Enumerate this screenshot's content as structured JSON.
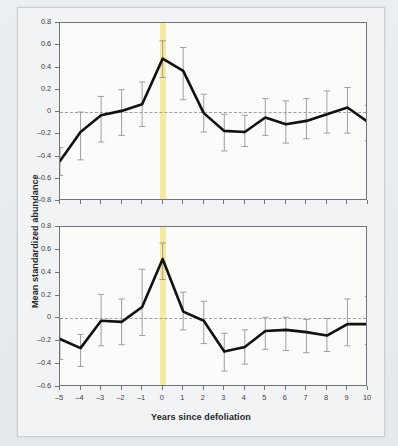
{
  "figure": {
    "yaxis_title": "Mean standardized abundance",
    "xaxis_title": "Years since defoliation",
    "band_color": "#f3e89c",
    "line_color": "#111111",
    "error_color": "#8c9094"
  },
  "chart_data": [
    {
      "type": "line",
      "title": "BLACK-BILLED CUCKOO",
      "xlabel": "Years since defoliation",
      "ylabel": "Mean standardized abundance",
      "x": [
        -5,
        -4,
        -3,
        -2,
        -1,
        0,
        1,
        2,
        3,
        4,
        5,
        6,
        7,
        8,
        9,
        10
      ],
      "xticklabels": [
        "-5",
        "-4",
        "-3",
        "-2",
        "-1",
        "0",
        "1",
        "2",
        "3",
        "4",
        "5",
        "6",
        "7",
        "8",
        "9",
        "10"
      ],
      "yticklabels": [
        "0.8",
        "0.6",
        "0.4",
        "0.2",
        "0",
        "-0.2",
        "-0.4",
        "-0.6",
        "-0.8"
      ],
      "ylim": [
        -0.8,
        0.8
      ],
      "xlim": [
        -5,
        10
      ],
      "values": [
        -0.44,
        -0.18,
        -0.03,
        0.01,
        0.07,
        0.48,
        0.37,
        -0.01,
        -0.17,
        -0.18,
        -0.05,
        -0.11,
        -0.08,
        -0.02,
        0.04,
        -0.09
      ],
      "err_upper": [
        -0.32,
        0.0,
        0.14,
        0.2,
        0.27,
        0.64,
        0.58,
        0.16,
        -0.02,
        -0.03,
        0.12,
        0.1,
        0.12,
        0.19,
        0.22,
        0.06
      ],
      "err_lower": [
        -0.57,
        -0.43,
        -0.27,
        -0.21,
        -0.13,
        0.31,
        0.11,
        -0.18,
        -0.35,
        -0.31,
        -0.21,
        -0.28,
        -0.24,
        -0.19,
        -0.19,
        -0.26
      ],
      "grid": false,
      "legend": "none",
      "highlight_x": 0,
      "zero_reference_line": 0
    },
    {
      "type": "line",
      "title": "YELLOW-BILLED CUCKOO",
      "xlabel": "Years since defoliation",
      "ylabel": "Mean standardized abundance",
      "x": [
        -5,
        -4,
        -3,
        -2,
        -1,
        0,
        1,
        2,
        3,
        4,
        5,
        6,
        7,
        8,
        9,
        10
      ],
      "xticklabels": [
        "-5",
        "-4",
        "-3",
        "-2",
        "-1",
        "0",
        "1",
        "2",
        "3",
        "4",
        "5",
        "6",
        "7",
        "8",
        "9",
        "10"
      ],
      "yticklabels": [
        "0.8",
        "0.6",
        "0.4",
        "0.2",
        "0",
        "-0.2",
        "-0.4",
        "-0.6"
      ],
      "ylim": [
        -0.6,
        0.8
      ],
      "xlim": [
        -5,
        10
      ],
      "values": [
        -0.18,
        -0.26,
        -0.02,
        -0.03,
        0.1,
        0.52,
        0.06,
        -0.02,
        -0.29,
        -0.25,
        -0.11,
        -0.1,
        -0.12,
        -0.15,
        -0.05,
        -0.05
      ],
      "err_upper": [
        0.0,
        -0.14,
        0.21,
        0.17,
        0.43,
        0.66,
        0.23,
        0.15,
        -0.13,
        -0.1,
        0.01,
        0.01,
        -0.01,
        0.0,
        0.17,
        0.19
      ],
      "err_lower": [
        -0.36,
        -0.42,
        -0.24,
        -0.23,
        -0.15,
        0.34,
        -0.1,
        -0.22,
        -0.46,
        -0.4,
        -0.27,
        -0.28,
        -0.3,
        -0.29,
        -0.24,
        -0.23
      ],
      "grid": false,
      "legend": "none",
      "highlight_x": 0,
      "zero_reference_line": 0
    }
  ]
}
